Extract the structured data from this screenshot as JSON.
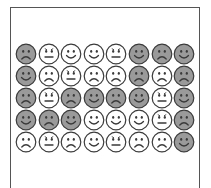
{
  "colors": {
    "gray_fill": "#9a9a9a",
    "white_fill": "#ffffff",
    "outline": "#3a3a3a",
    "frame": "#555555"
  },
  "grid": {
    "rows": 5,
    "cols": 8,
    "faces": [
      [
        {
          "fill": "gray",
          "mood": "sad"
        },
        {
          "fill": "white",
          "mood": "neutral"
        },
        {
          "fill": "white",
          "mood": "happy"
        },
        {
          "fill": "white",
          "mood": "happy"
        },
        {
          "fill": "white",
          "mood": "neutral"
        },
        {
          "fill": "gray",
          "mood": "happy"
        },
        {
          "fill": "gray",
          "mood": "sad"
        },
        {
          "fill": "gray",
          "mood": "happy"
        }
      ],
      [
        {
          "fill": "gray",
          "mood": "happy"
        },
        {
          "fill": "white",
          "mood": "sad"
        },
        {
          "fill": "white",
          "mood": "neutral"
        },
        {
          "fill": "white",
          "mood": "sad"
        },
        {
          "fill": "white",
          "mood": "sad"
        },
        {
          "fill": "gray",
          "mood": "sad"
        },
        {
          "fill": "white",
          "mood": "sad"
        },
        {
          "fill": "gray",
          "mood": "sad"
        }
      ],
      [
        {
          "fill": "gray",
          "mood": "sad"
        },
        {
          "fill": "white",
          "mood": "neutral"
        },
        {
          "fill": "gray",
          "mood": "sad"
        },
        {
          "fill": "gray",
          "mood": "happy"
        },
        {
          "fill": "gray",
          "mood": "sad"
        },
        {
          "fill": "gray",
          "mood": "happy"
        },
        {
          "fill": "white",
          "mood": "neutral"
        },
        {
          "fill": "gray",
          "mood": "happy"
        }
      ],
      [
        {
          "fill": "gray",
          "mood": "happy"
        },
        {
          "fill": "gray",
          "mood": "sad"
        },
        {
          "fill": "gray",
          "mood": "happy"
        },
        {
          "fill": "white",
          "mood": "happy"
        },
        {
          "fill": "white",
          "mood": "happy"
        },
        {
          "fill": "white",
          "mood": "happy"
        },
        {
          "fill": "white",
          "mood": "neutral"
        },
        {
          "fill": "gray",
          "mood": "sad"
        }
      ],
      [
        {
          "fill": "white",
          "mood": "sad"
        },
        {
          "fill": "white",
          "mood": "neutral"
        },
        {
          "fill": "white",
          "mood": "sad"
        },
        {
          "fill": "white",
          "mood": "happy"
        },
        {
          "fill": "white",
          "mood": "neutral"
        },
        {
          "fill": "white",
          "mood": "sad"
        },
        {
          "fill": "white",
          "mood": "sad"
        },
        {
          "fill": "gray",
          "mood": "happy"
        }
      ]
    ]
  }
}
